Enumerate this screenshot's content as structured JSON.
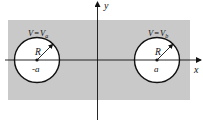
{
  "diagram": {
    "axes": {
      "x_label": "x",
      "y_label": "y"
    },
    "region": {
      "fill": "#c9c9c9"
    },
    "left_cylinder": {
      "potential_label_V": "V",
      "potential_label_eq": "=",
      "potential_label_Vsym": "V",
      "potential_label_sub": "a",
      "radius_label": "R",
      "center_label": "-a"
    },
    "right_cylinder": {
      "potential_label_V": "V",
      "potential_label_eq": "=",
      "potential_label_Vsym": "V",
      "potential_label_sub": "b",
      "radius_label": "R",
      "center_label": "a"
    }
  }
}
